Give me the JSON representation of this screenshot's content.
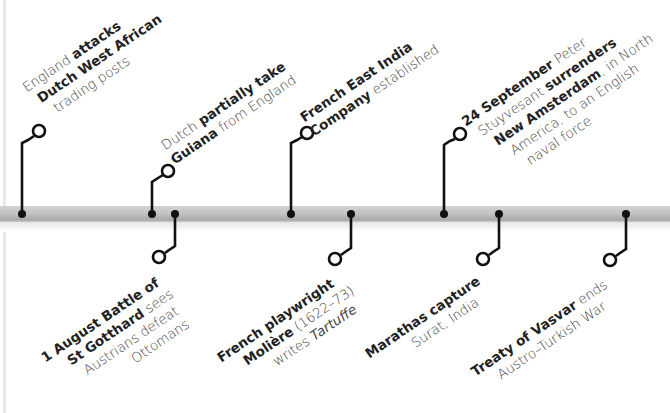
{
  "timeline": {
    "bar_color": "#bdbdbd",
    "connector_color": "#111111",
    "events_above": [
      {
        "marker_x": 22,
        "lines": [
          [
            {
              "t": "England ",
              "w": "normal"
            },
            {
              "t": "attacks",
              "w": "bold"
            }
          ],
          [
            {
              "t": "Dutch West African",
              "w": "bold"
            }
          ],
          [
            {
              "t": "trading posts",
              "w": "normal"
            }
          ]
        ]
      },
      {
        "marker_x": 152,
        "lines": [
          [
            {
              "t": "Dutch ",
              "w": "normal"
            },
            {
              "t": "partially take",
              "w": "bold"
            }
          ],
          [
            {
              "t": "Guiana",
              "w": "bold"
            },
            {
              "t": " from England",
              "w": "normal"
            }
          ]
        ]
      },
      {
        "marker_x": 291,
        "lines": [
          [
            {
              "t": "French East India",
              "w": "bold"
            }
          ],
          [
            {
              "t": "Company",
              "w": "bold"
            },
            {
              "t": " established",
              "w": "normal"
            }
          ]
        ]
      },
      {
        "marker_x": 444,
        "lines": [
          [
            {
              "t": "24 September",
              "w": "bold"
            },
            {
              "t": " Peter",
              "w": "normal"
            }
          ],
          [
            {
              "t": "Stuyvesant ",
              "w": "normal"
            },
            {
              "t": "surrenders",
              "w": "bold"
            }
          ],
          [
            {
              "t": "New Amsterdam",
              "w": "bold"
            },
            {
              "t": ", in North",
              "w": "normal"
            }
          ],
          [
            {
              "t": "America, to an English",
              "w": "normal"
            }
          ],
          [
            {
              "t": "naval force",
              "w": "normal"
            }
          ]
        ]
      }
    ],
    "events_below": [
      {
        "marker_x": 175,
        "lines": [
          [
            {
              "t": "1 August Battle of",
              "w": "bold"
            }
          ],
          [
            {
              "t": "St Gotthard",
              "w": "bold"
            },
            {
              "t": " sees",
              "w": "normal"
            }
          ],
          [
            {
              "t": "Austrians defeat",
              "w": "normal"
            }
          ],
          [
            {
              "t": "Ottomans",
              "w": "normal"
            }
          ]
        ]
      },
      {
        "marker_x": 351,
        "lines": [
          [
            {
              "t": "French playwright",
              "w": "bold"
            }
          ],
          [
            {
              "t": "Molière",
              "w": "bold"
            },
            {
              "t": " (1622–73)",
              "w": "normal"
            }
          ],
          [
            {
              "t": "writes ",
              "w": "normal"
            },
            {
              "t": "Tartuffe",
              "w": "italic"
            }
          ]
        ]
      },
      {
        "marker_x": 499,
        "lines": [
          [
            {
              "t": "Marathas capture",
              "w": "bold"
            }
          ],
          [
            {
              "t": "Surat, India",
              "w": "normal"
            }
          ]
        ]
      },
      {
        "marker_x": 626,
        "lines": [
          [
            {
              "t": "Treaty of Vasvar",
              "w": "bold"
            },
            {
              "t": " ends",
              "w": "normal"
            }
          ],
          [
            {
              "t": "Austro–Turkish War",
              "w": "normal"
            }
          ]
        ]
      }
    ]
  }
}
